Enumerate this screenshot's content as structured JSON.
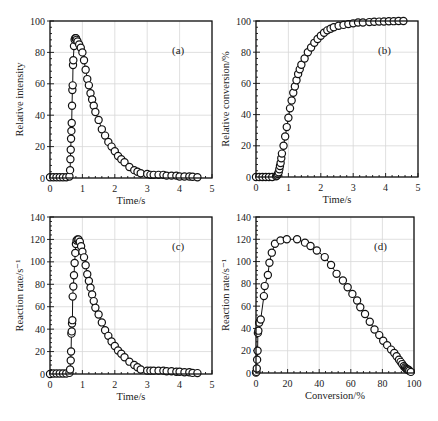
{
  "chart_data": [
    {
      "id": "a",
      "type": "scatter",
      "panel_label": "(a)",
      "xlabel": "Time/s",
      "ylabel": "Relative intensity",
      "xlim": [
        0,
        5
      ],
      "ylim": [
        0,
        100
      ],
      "xticks": [
        0,
        1,
        2,
        3,
        4,
        5
      ],
      "yticks": [
        0,
        20,
        40,
        60,
        80,
        100
      ],
      "grid": true,
      "box": {
        "x0": 50,
        "x1": 212,
        "y0": 178,
        "y1": 21
      },
      "x": [
        0,
        0.1,
        0.2,
        0.3,
        0.4,
        0.5,
        0.6,
        0.62,
        0.63,
        0.64,
        0.65,
        0.66,
        0.67,
        0.68,
        0.69,
        0.7,
        0.71,
        0.72,
        0.74,
        0.76,
        0.78,
        0.8,
        0.82,
        0.85,
        0.9,
        0.95,
        1.0,
        1.05,
        1.1,
        1.15,
        1.2,
        1.25,
        1.3,
        1.35,
        1.4,
        1.5,
        1.6,
        1.7,
        1.8,
        1.9,
        2.0,
        2.1,
        2.2,
        2.3,
        2.45,
        2.6,
        2.7,
        2.8,
        3.0,
        3.1,
        3.2,
        3.35,
        3.5,
        3.6,
        3.75,
        3.9,
        4.0,
        4.15,
        4.3,
        4.4,
        4.55
      ],
      "values": [
        0.5,
        0.5,
        0.5,
        0.5,
        0.5,
        0.5,
        1,
        5,
        12,
        18,
        25,
        30,
        35,
        46,
        56,
        59,
        72,
        75,
        84,
        88,
        89,
        89,
        88,
        87,
        85,
        83,
        80,
        75,
        69,
        63,
        59,
        54,
        50,
        46,
        42,
        37,
        31,
        27,
        23,
        20,
        17,
        14,
        12,
        10,
        7,
        5,
        4,
        3,
        2.5,
        2,
        2,
        2,
        2,
        1.5,
        1.5,
        1.5,
        1,
        1,
        1,
        0.8,
        0.5
      ]
    },
    {
      "id": "b",
      "type": "scatter",
      "panel_label": "(b)",
      "xlabel": "Time/s",
      "ylabel": "Relative conversion/%",
      "xlim": [
        0,
        5
      ],
      "ylim": [
        0,
        100
      ],
      "xticks": [
        0,
        1,
        2,
        3,
        4,
        5
      ],
      "yticks": [
        0,
        20,
        40,
        60,
        80,
        100
      ],
      "grid": true,
      "box": {
        "x0": 256,
        "x1": 418,
        "y0": 177,
        "y1": 21
      },
      "x": [
        0,
        0.1,
        0.2,
        0.3,
        0.4,
        0.5,
        0.62,
        0.65,
        0.68,
        0.7,
        0.72,
        0.74,
        0.76,
        0.78,
        0.8,
        0.85,
        0.9,
        0.95,
        1.0,
        1.05,
        1.1,
        1.15,
        1.2,
        1.25,
        1.3,
        1.35,
        1.4,
        1.5,
        1.6,
        1.7,
        1.8,
        1.9,
        2.0,
        2.1,
        2.2,
        2.3,
        2.4,
        2.55,
        2.7,
        2.85,
        3.0,
        3.15,
        3.3,
        3.5,
        3.65,
        3.8,
        3.95,
        4.1,
        4.25,
        4.4,
        4.55
      ],
      "values": [
        0,
        0,
        0,
        0,
        0,
        0,
        0.5,
        1,
        2,
        3,
        5,
        7,
        9,
        12,
        15,
        20,
        26,
        32,
        38,
        44,
        49,
        54,
        58,
        62,
        66,
        69,
        72,
        76,
        80,
        83,
        86,
        88.5,
        90.5,
        92.5,
        94,
        95,
        96,
        97,
        97.5,
        98,
        98.5,
        99,
        99,
        99.3,
        99.5,
        99.6,
        99.7,
        99.8,
        99.9,
        100,
        100
      ]
    },
    {
      "id": "c",
      "type": "scatter",
      "panel_label": "(c)",
      "xlabel": "Time/s",
      "ylabel": "Reaction rate/s⁻¹",
      "xlim": [
        0,
        5
      ],
      "ylim": [
        0,
        140
      ],
      "xticks": [
        0,
        1,
        2,
        3,
        4,
        5
      ],
      "yticks": [
        0,
        20,
        40,
        60,
        80,
        100,
        120,
        140
      ],
      "grid": true,
      "box": {
        "x0": 50,
        "x1": 212,
        "y0": 374,
        "y1": 217
      },
      "x": [
        0,
        0.1,
        0.2,
        0.3,
        0.4,
        0.5,
        0.6,
        0.62,
        0.64,
        0.65,
        0.66,
        0.67,
        0.68,
        0.69,
        0.7,
        0.72,
        0.74,
        0.76,
        0.78,
        0.8,
        0.82,
        0.85,
        0.88,
        0.92,
        0.96,
        1.0,
        1.05,
        1.1,
        1.15,
        1.2,
        1.25,
        1.3,
        1.35,
        1.4,
        1.5,
        1.6,
        1.7,
        1.8,
        1.9,
        2.0,
        2.1,
        2.2,
        2.3,
        2.45,
        2.6,
        2.7,
        2.8,
        3.0,
        3.1,
        3.2,
        3.35,
        3.5,
        3.6,
        3.75,
        3.9,
        4.0,
        4.15,
        4.3,
        4.4,
        4.55
      ],
      "values": [
        0,
        0.5,
        0.5,
        0.5,
        0.5,
        0.5,
        1,
        4,
        12,
        20,
        36,
        38,
        45,
        48,
        69,
        78,
        88,
        99,
        108,
        116,
        119,
        120,
        120,
        118,
        114,
        109,
        104,
        97,
        89,
        83,
        77,
        71,
        65,
        59,
        53,
        46,
        39,
        34,
        29,
        25,
        21,
        18,
        15,
        11,
        8,
        6,
        4,
        3,
        3,
        3,
        3,
        3,
        2.5,
        2.5,
        2,
        2,
        1.5,
        1.5,
        1,
        0.8
      ]
    },
    {
      "id": "d",
      "type": "scatter",
      "panel_label": "(d)",
      "xlabel": "Conversion/%",
      "ylabel": "Reaction rate/s⁻¹",
      "xlim": [
        0,
        100
      ],
      "ylim": [
        0,
        140
      ],
      "xticks": [
        0,
        20,
        40,
        60,
        80,
        100
      ],
      "yticks": [
        0,
        20,
        40,
        60,
        80,
        100,
        120,
        140
      ],
      "grid": true,
      "box": {
        "x0": 256,
        "x1": 414,
        "y0": 373,
        "y1": 217
      },
      "x": [
        0,
        0.3,
        0.5,
        0.7,
        1.0,
        1.2,
        1.5,
        2.0,
        3.0,
        5.0,
        5.5,
        7.5,
        8.5,
        10,
        12,
        15.5,
        19.5,
        26,
        31,
        34.5,
        38.5,
        43.5,
        47.5,
        51,
        55,
        58,
        61,
        64,
        66,
        69,
        72,
        75,
        78,
        80.5,
        83,
        85.5,
        87.5,
        89,
        90.5,
        91.5,
        92.5,
        93.5,
        94.3,
        95,
        95.5,
        96,
        96.5,
        97,
        98
      ],
      "values": [
        0.5,
        1,
        4,
        12,
        20,
        36,
        38,
        45,
        48,
        69,
        78,
        88,
        99,
        108,
        116,
        119,
        120,
        120,
        117,
        114,
        110,
        104,
        97,
        89,
        83,
        77,
        71,
        65,
        59,
        53,
        46,
        39,
        34,
        29,
        25,
        21,
        18,
        15,
        12,
        10,
        8,
        6,
        5,
        4,
        3.5,
        3,
        3,
        2,
        1
      ]
    }
  ]
}
